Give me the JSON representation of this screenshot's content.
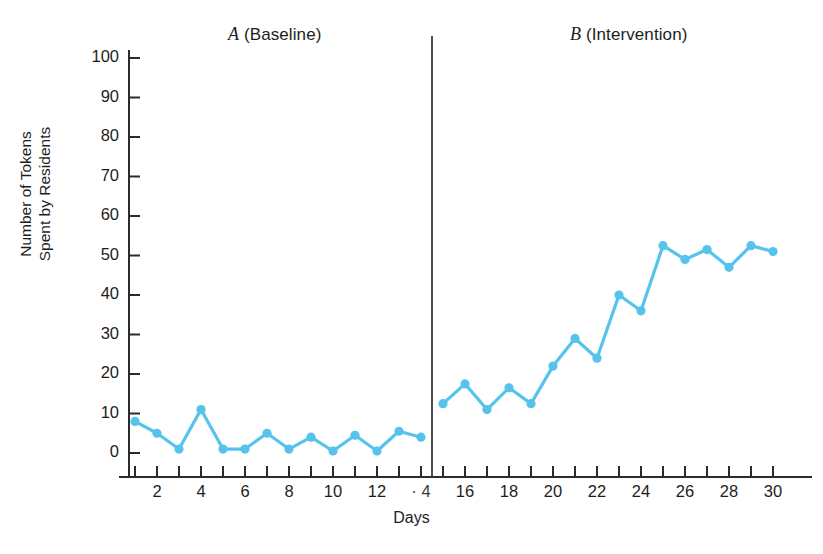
{
  "chart_data": {
    "type": "line",
    "title": "",
    "xlabel": "Days",
    "ylabel": "Number of Tokens Spent by Residents",
    "ylabel_line1": "Number of Tokens",
    "ylabel_line2": "Spent by Residents",
    "xlim": [
      0,
      31
    ],
    "ylim": [
      0,
      100
    ],
    "grid": false,
    "legend": "none",
    "line_color": "#55c3ec",
    "marker_color": "#55c3ec",
    "y_ticks": [
      0,
      10,
      20,
      30,
      40,
      50,
      60,
      70,
      80,
      90,
      100
    ],
    "y_tick_labels": [
      "0",
      "10",
      "20",
      "30",
      "40",
      "50",
      "60",
      "70",
      "80",
      "90",
      "100"
    ],
    "x_minor_ticks": [
      1,
      2,
      3,
      4,
      5,
      6,
      7,
      8,
      9,
      10,
      11,
      12,
      13,
      14,
      15,
      16,
      17,
      18,
      19,
      20,
      21,
      22,
      23,
      24,
      25,
      26,
      27,
      28,
      29,
      30
    ],
    "x_ticks": [
      2,
      4,
      6,
      8,
      10,
      12,
      14,
      16,
      18,
      20,
      22,
      24,
      26,
      28,
      30
    ],
    "x_tick_labels": [
      "2",
      "4",
      "6",
      "8",
      "10",
      "12",
      "· 4",
      "16",
      "18",
      "20",
      "22",
      "24",
      "26",
      "28",
      "30"
    ],
    "phases": [
      {
        "id": "A",
        "letter": "A",
        "name": "(Baseline)",
        "label": "A (Baseline)",
        "x_start": 1,
        "x_end": 14
      },
      {
        "id": "B",
        "letter": "B",
        "name": "(Intervention)",
        "label": "B (Intervention)",
        "x_start": 15,
        "x_end": 30
      }
    ],
    "phase_divider_x": 14.5,
    "x": [
      1,
      2,
      3,
      4,
      5,
      6,
      7,
      8,
      9,
      10,
      11,
      12,
      13,
      14,
      15,
      16,
      17,
      18,
      19,
      20,
      21,
      22,
      23,
      24,
      25,
      26,
      27,
      28,
      29,
      30
    ],
    "values": [
      8,
      5,
      1,
      11,
      1,
      1,
      5,
      1,
      4,
      0.5,
      4.5,
      0.5,
      5.5,
      4,
      12.5,
      17.5,
      11,
      16.5,
      12.5,
      22,
      29,
      24,
      40,
      36,
      52.5,
      49,
      51.5,
      47,
      52.5,
      51
    ],
    "series": [
      {
        "name": "Tokens spent by residents",
        "segments": [
          {
            "phase": "A",
            "x": [
              1,
              2,
              3,
              4,
              5,
              6,
              7,
              8,
              9,
              10,
              11,
              12,
              13,
              14
            ],
            "values": [
              8,
              5,
              1,
              11,
              1,
              1,
              5,
              1,
              4,
              0.5,
              4.5,
              0.5,
              5.5,
              4
            ]
          },
          {
            "phase": "B",
            "x": [
              15,
              16,
              17,
              18,
              19,
              20,
              21,
              22,
              23,
              24,
              25,
              26,
              27,
              28,
              29,
              30
            ],
            "values": [
              12.5,
              17.5,
              11,
              16.5,
              12.5,
              22,
              29,
              24,
              40,
              36,
              52.5,
              49,
              51.5,
              47,
              52.5,
              51
            ]
          }
        ]
      }
    ]
  }
}
